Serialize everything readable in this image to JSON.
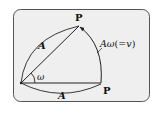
{
  "diagram": {
    "colors": {
      "panel_bg": "#efefef",
      "panel_border": "#555555",
      "stroke": "#222222",
      "text": "#111111"
    },
    "labels": {
      "point_top": "P",
      "point_right": "P",
      "radius_upper": "A",
      "radius_lower": "A",
      "angle": "ω",
      "arc_length_main": "Aω",
      "arc_length_eq": "(=",
      "arc_length_v": "v",
      "arc_length_close": ")"
    }
  }
}
